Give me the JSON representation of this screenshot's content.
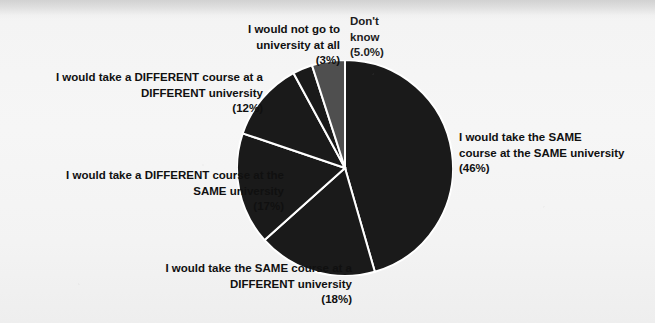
{
  "background": {
    "page_color": "#f4f4f4",
    "bleed_text_left": "",
    "bleed_text_right": ""
  },
  "chart_data": {
    "type": "pie",
    "title": "",
    "subtitle": "",
    "xlabel": "",
    "ylabel": "",
    "legend_position": "none",
    "grid": false,
    "start_angle_deg": 0,
    "direction": "clockwise",
    "center": {
      "x": 345,
      "y": 168
    },
    "radius": 108,
    "slice_border_color": "#ffffff",
    "slice_border_width": 2,
    "categories": [
      "I would take the SAME course at the SAME university",
      "I would take the SAME course at a DIFFERENT university",
      "I would take a DIFFERENT course at the SAME university",
      "I would take a DIFFERENT course at a DIFFERENT university",
      "I would not go to university at all",
      "Don't know"
    ],
    "values": [
      46,
      18,
      17,
      12,
      3,
      5
    ],
    "value_unit": "%",
    "colors": [
      "#1a1a1a",
      "#1a1a1a",
      "#1a1a1a",
      "#1a1a1a",
      "#1a1a1a",
      "#4f4f4f"
    ],
    "slices": [
      {
        "label_line1": "I would take the SAME",
        "label_line2": "course at the SAME university",
        "value_label": "(46%)",
        "value": 46,
        "color": "#1a1a1a"
      },
      {
        "label_line1": "I would take the SAME course at a",
        "label_line2": "DIFFERENT university",
        "value_label": "(18%)",
        "value": 18,
        "color": "#1a1a1a"
      },
      {
        "label_line1": "I would take a DIFFERENT course at the",
        "label_line2": "SAME university",
        "value_label": "(17%)",
        "value": 17,
        "color": "#1a1a1a"
      },
      {
        "label_line1": "I would take a DIFFERENT course at a",
        "label_line2": "DIFFERENT university",
        "value_label": "(12%)",
        "value": 12,
        "color": "#1a1a1a"
      },
      {
        "label_line1": "I would not go to",
        "label_line2": "university at all",
        "value_label": "(3%)",
        "value": 3,
        "color": "#1a1a1a"
      },
      {
        "label_line1": "Don't",
        "label_line2": "know",
        "value_label": "(5.0%)",
        "value": 5,
        "color": "#4f4f4f"
      }
    ]
  },
  "labels": {
    "same_same": "I would take the SAME\ncourse at the SAME university\n(46%)",
    "same_diff": "I would take the SAME course at a\nDIFFERENT university\n(18%)",
    "diff_same": "I would take a DIFFERENT course at the\nSAME university\n(17%)",
    "diff_diff": "I would take a DIFFERENT course at a\nDIFFERENT university\n(12%)",
    "not_go": "I would not go to\nuniversity at all\n(3%)",
    "dont_know": "Don't\nknow\n(5.0%)"
  }
}
